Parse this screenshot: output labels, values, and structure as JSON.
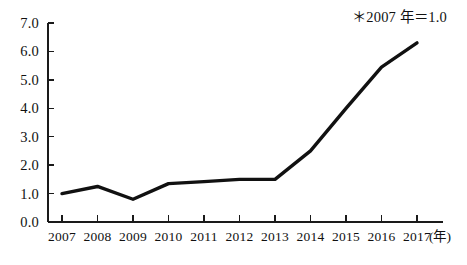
{
  "chart_data": {
    "type": "line",
    "title": "",
    "subtitle": "",
    "xlabel": "(年)",
    "ylabel": "",
    "annotation": "＊2007 年＝1.0",
    "grid": false,
    "legend": false,
    "legend_position": "none",
    "line_color": "#111111",
    "axis_color": "#1a1a1a",
    "categories": [
      "2007",
      "2008",
      "2009",
      "2010",
      "2011",
      "2012",
      "2013",
      "2014",
      "2015",
      "2016",
      "2017"
    ],
    "x": [
      2007,
      2008,
      2009,
      2010,
      2011,
      2012,
      2013,
      2014,
      2015,
      2016,
      2017
    ],
    "values": [
      1.0,
      1.25,
      0.8,
      1.35,
      1.42,
      1.5,
      1.5,
      2.5,
      4.0,
      5.45,
      6.3
    ],
    "ylim": [
      0.0,
      7.0
    ],
    "ytick_values": [
      0.0,
      1.0,
      2.0,
      3.0,
      4.0,
      5.0,
      6.0,
      7.0
    ],
    "ytick_labels": [
      "0.0",
      "1.0",
      "2.0",
      "3.0",
      "4.0",
      "5.0",
      "6.0",
      "7.0"
    ],
    "xtick_labels": [
      "2007",
      "2008",
      "2009",
      "2010",
      "2011",
      "2012",
      "2013",
      "2014",
      "2015",
      "2016",
      "2017"
    ]
  }
}
